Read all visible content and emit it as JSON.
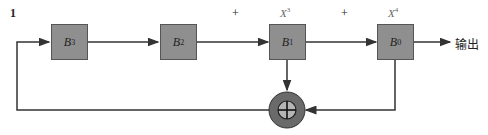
{
  "diagram": {
    "input_label": "1",
    "registers": [
      {
        "name": "B",
        "sub": "3"
      },
      {
        "name": "B",
        "sub": "2"
      },
      {
        "name": "B",
        "sub": "1"
      },
      {
        "name": "B",
        "sub": "0"
      }
    ],
    "plus_signs": [
      "+",
      "+"
    ],
    "taps": [
      {
        "base": "X",
        "exp": "3"
      },
      {
        "base": "X",
        "exp": "4"
      }
    ],
    "output_label": "输出",
    "adder_symbol": "xor-adder",
    "colors": {
      "register_fill": "#8f8f8f",
      "adder_outer": "#6a6a6a",
      "adder_inner": "#b5b5b5",
      "line": "#333333"
    }
  }
}
